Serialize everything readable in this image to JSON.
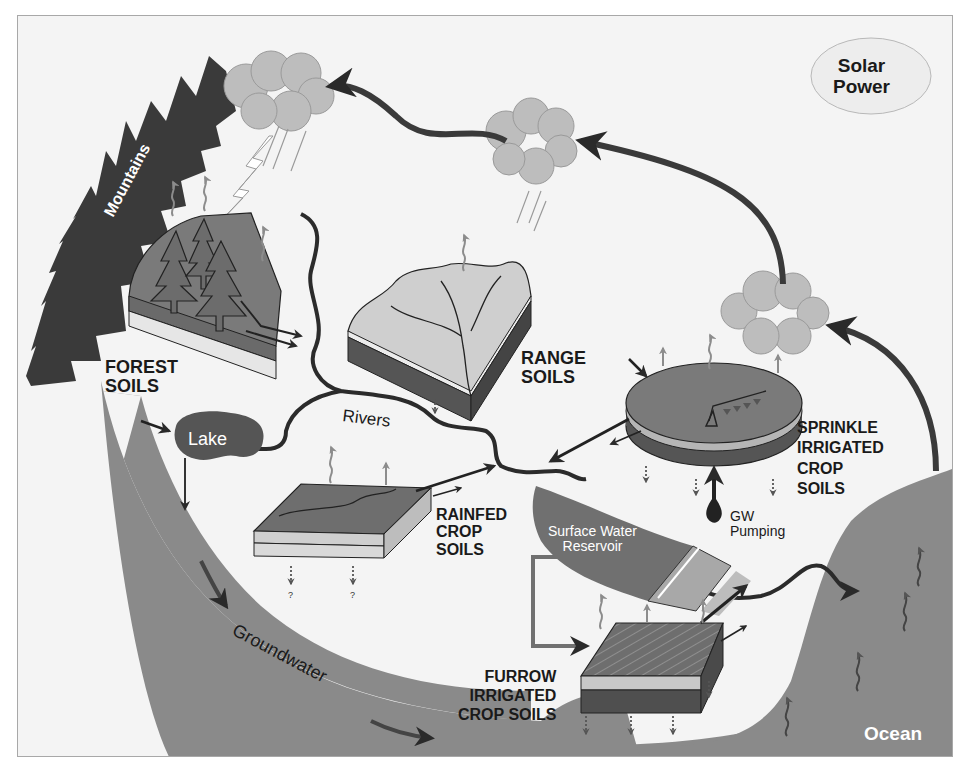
{
  "diagram": {
    "title": "",
    "type": "hydrologic-cycle-schematic",
    "colors": {
      "background": "#f4f4f4",
      "frame": "#a8a8a8",
      "mountains": "#3a3a3a",
      "groundwater": "#8a8a8a",
      "ocean": "#8a8a8a",
      "cloud": "#bdbdbd",
      "lake": "#555555",
      "reservoir": "#707070",
      "river": "#2b2b2b",
      "arrow": "#3a3a3a",
      "evap_arrow": "#8c8c8c",
      "text": "#1a1a1a"
    },
    "labels": {
      "solar_power": "Solar\nPower",
      "mountains": "Mountains",
      "forest_soils": "FOREST\nSOILS",
      "range_soils": "RANGE\nSOILS",
      "lake": "Lake",
      "rivers": "Rivers",
      "rainfed_crop_soils": "RAINFED\nCROP\nSOILS",
      "sprinkle_irrigated_crop_soils": "SPRINKLE\nIRRIGATED\nCROP\nSOILS",
      "gw_pumping": "GW\nPumping",
      "surface_water_reservoir": "Surface Water\nReservoir",
      "furrow_irrigated_crop_soils": "FURROW\nIRRIGATED\nCROP SOILS",
      "groundwater": "Groundwater",
      "ocean": "Ocean",
      "unknown_percolation_1": "?",
      "unknown_percolation_2": "?"
    },
    "nodes": [
      {
        "id": "solar_power",
        "shape": "ellipse"
      },
      {
        "id": "cloud_left",
        "shape": "cloud"
      },
      {
        "id": "cloud_middle",
        "shape": "cloud"
      },
      {
        "id": "cloud_right",
        "shape": "cloud"
      },
      {
        "id": "mountains",
        "shape": "jagged-band"
      },
      {
        "id": "forest_soils",
        "shape": "soil-block-with-trees"
      },
      {
        "id": "range_soils",
        "shape": "soil-block-with-channels"
      },
      {
        "id": "lake",
        "shape": "blob"
      },
      {
        "id": "rivers",
        "shape": "line"
      },
      {
        "id": "rainfed_crop_soils",
        "shape": "soil-block"
      },
      {
        "id": "sprinkle_irrigated_crop_soils",
        "shape": "cylinder-with-pivot"
      },
      {
        "id": "surface_water_reservoir",
        "shape": "lens"
      },
      {
        "id": "furrow_irrigated_crop_soils",
        "shape": "soil-block"
      },
      {
        "id": "groundwater",
        "shape": "curved-band"
      },
      {
        "id": "ocean",
        "shape": "region"
      }
    ],
    "flows": [
      {
        "from": "cloud_right",
        "to": "cloud_middle",
        "type": "atmospheric transport"
      },
      {
        "from": "cloud_middle",
        "to": "cloud_left",
        "type": "atmospheric transport"
      },
      {
        "from": "ocean",
        "to": "cloud_right",
        "type": "evaporation"
      },
      {
        "from": "cloud_left",
        "to": "forest_soils",
        "type": "precipitation"
      },
      {
        "from": "forest_soils",
        "to": "rivers",
        "type": "runoff"
      },
      {
        "from": "range_soils",
        "to": "rivers",
        "type": "runoff"
      },
      {
        "from": "lake",
        "to": "groundwater",
        "type": "seepage"
      },
      {
        "from": "rainfed_crop_soils",
        "to": "rivers",
        "type": "runoff"
      },
      {
        "from": "sprinkle_irrigated_crop_soils",
        "to": "rivers",
        "type": "return flow"
      },
      {
        "from": "groundwater",
        "to": "sprinkle_irrigated_crop_soils",
        "type": "GW pumping"
      },
      {
        "from": "surface_water_reservoir",
        "to": "furrow_irrigated_crop_soils",
        "type": "irrigation diversion"
      },
      {
        "from": "furrow_irrigated_crop_soils",
        "to": "rivers",
        "type": "return flow"
      },
      {
        "from": "rivers",
        "to": "ocean",
        "type": "streamflow"
      }
    ]
  }
}
